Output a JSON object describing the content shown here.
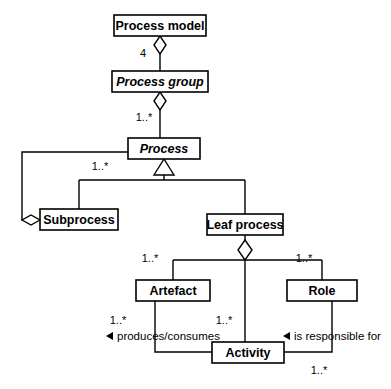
{
  "diagram": {
    "type": "uml-class-diagram",
    "background_color": "#ffffff",
    "line_color": "#000000",
    "box_fill": "#ffffff"
  },
  "classes": [
    {
      "id": "process_model",
      "name": "Process model",
      "abstract": false,
      "x": 114,
      "y": 15,
      "w": 92,
      "h": 21
    },
    {
      "id": "process_group",
      "name": "Process group",
      "abstract": true,
      "x": 112,
      "y": 71,
      "w": 96,
      "h": 21
    },
    {
      "id": "process",
      "name": "Process",
      "abstract": true,
      "x": 128,
      "y": 138,
      "w": 72,
      "h": 21
    },
    {
      "id": "subprocess",
      "name": "Subprocess",
      "abstract": false,
      "x": 40,
      "y": 209,
      "w": 78,
      "h": 21
    },
    {
      "id": "leaf_process",
      "name": "Leaf process",
      "abstract": false,
      "x": 207,
      "y": 214,
      "w": 76,
      "h": 21
    },
    {
      "id": "artefact",
      "name": "Artefact",
      "abstract": false,
      "x": 136,
      "y": 280,
      "w": 74,
      "h": 21
    },
    {
      "id": "role",
      "name": "Role",
      "abstract": false,
      "x": 287,
      "y": 280,
      "w": 70,
      "h": 21
    },
    {
      "id": "activity",
      "name": "Activity",
      "abstract": false,
      "x": 212,
      "y": 342,
      "w": 72,
      "h": 21
    }
  ],
  "multiplicities": [
    {
      "id": "m_pm_pg",
      "text": "4",
      "x": 143,
      "y": 54
    },
    {
      "id": "m_pg_p",
      "text": "1..*",
      "x": 144,
      "y": 118
    },
    {
      "id": "m_p_sub",
      "text": "1..*",
      "x": 100,
      "y": 167
    },
    {
      "id": "m_lp_art",
      "text": "1..*",
      "x": 150,
      "y": 259
    },
    {
      "id": "m_lp_role",
      "text": "1..*",
      "x": 304,
      "y": 259
    },
    {
      "id": "m_lp_act",
      "text": "1..*",
      "x": 224,
      "y": 321
    },
    {
      "id": "m_art_act",
      "text": "1..*",
      "x": 118,
      "y": 321
    },
    {
      "id": "m_role_act",
      "text": "1..*",
      "x": 319,
      "y": 371
    }
  ],
  "association_labels": [
    {
      "id": "produces_consumes",
      "text": "produces/consumes",
      "x": 118,
      "y": 336,
      "marker": "left-triangle",
      "marker_x": 110,
      "marker_y": 336
    },
    {
      "id": "is_responsible_for",
      "text": "is responsible for",
      "x": 295,
      "y": 336,
      "marker": "left-triangle",
      "marker_x": 287,
      "marker_y": 336
    }
  ],
  "relationships": [
    {
      "id": "r1",
      "kind": "aggregation",
      "from": "process_model",
      "to": "process_group",
      "multiplicity": "4"
    },
    {
      "id": "r2",
      "kind": "aggregation",
      "from": "process_group",
      "to": "process",
      "multiplicity": "1..*"
    },
    {
      "id": "r3",
      "kind": "generalization",
      "from": "subprocess",
      "to": "process"
    },
    {
      "id": "r4",
      "kind": "generalization",
      "from": "leaf_process",
      "to": "process"
    },
    {
      "id": "r5",
      "kind": "aggregation",
      "from": "process",
      "to": "subprocess",
      "multiplicity": "1..*"
    },
    {
      "id": "r6",
      "kind": "aggregation",
      "from": "leaf_process",
      "to": "artefact",
      "multiplicity": "1..*"
    },
    {
      "id": "r7",
      "kind": "aggregation",
      "from": "leaf_process",
      "to": "activity",
      "multiplicity": "1..*"
    },
    {
      "id": "r8",
      "kind": "aggregation",
      "from": "leaf_process",
      "to": "role",
      "multiplicity": "1..*"
    },
    {
      "id": "r9",
      "kind": "association",
      "from": "artefact",
      "to": "activity",
      "label": "produces/consumes",
      "multiplicity": "1..*"
    },
    {
      "id": "r10",
      "kind": "association",
      "from": "role",
      "to": "activity",
      "label": "is responsible for",
      "multiplicity": "1..*"
    }
  ]
}
